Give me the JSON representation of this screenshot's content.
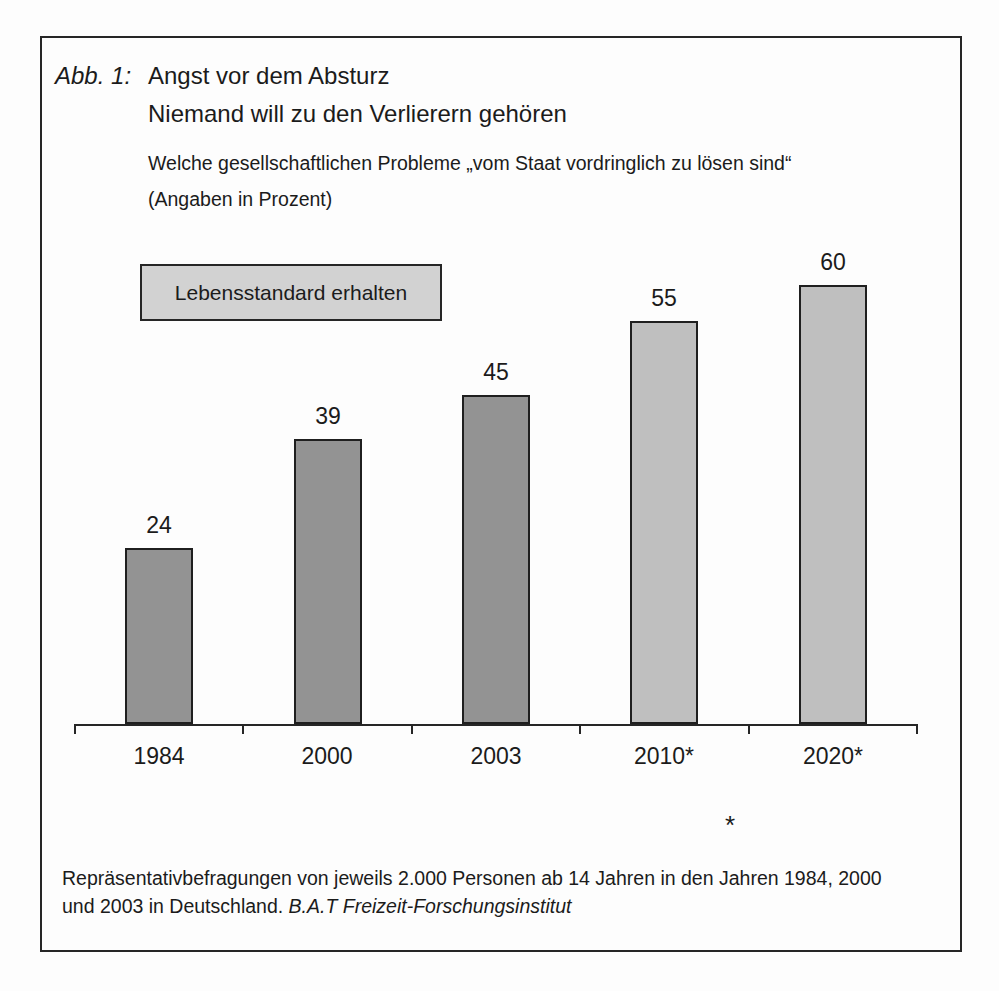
{
  "header": {
    "figure_label": "Abb. 1:",
    "title_line1": "Angst vor dem Absturz",
    "title_line2": "Niemand will zu den Verlierern gehören",
    "subtitle_line1": "Welche gesellschaftlichen Probleme „vom Staat vordringlich zu lösen sind“",
    "subtitle_line2": "(Angaben in Prozent)"
  },
  "legend": {
    "label": "Lebensstandard erhalten",
    "fill_color": "#d2d2d2"
  },
  "chart_data": {
    "type": "bar",
    "categories": [
      "1984",
      "2000",
      "2003",
      "2010*",
      "2020*"
    ],
    "values": [
      24,
      39,
      45,
      55,
      60
    ],
    "bar_colors": [
      "#939393",
      "#939393",
      "#939393",
      "#bfbfbf",
      "#bfbfbf"
    ],
    "series_label": "Lebensstandard erhalten",
    "xlabel": "",
    "ylabel": "",
    "unit": "Prozent",
    "ylim": [
      0,
      62
    ],
    "grid": false,
    "value_labels_shown": true,
    "legend_position": "top-left",
    "outline_color": "#1f1f1f"
  },
  "footnote": {
    "marker": "*"
  },
  "footer": {
    "line1": "Repräsentativbefragungen von jeweils 2.000 Personen ab 14 Jahren in den Jahren 1984, 2000",
    "line2_plain": "und 2003 in Deutschland. ",
    "line2_italic": "B.A.T Freizeit-Forschungsinstitut"
  }
}
